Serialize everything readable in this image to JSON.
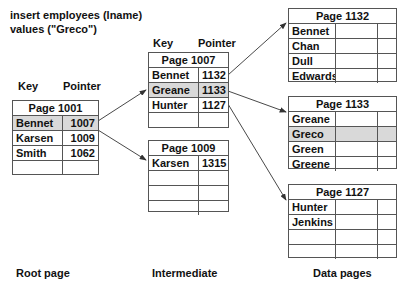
{
  "query": {
    "line1": "insert employees (lname)",
    "line2": "values (\"Greco\")"
  },
  "root": {
    "key_header": "Key",
    "pointer_header": "Pointer",
    "title": "Page 1001",
    "rows": [
      {
        "key": "Bennet",
        "pointer": "1007",
        "highlight": true
      },
      {
        "key": "Karsen",
        "pointer": "1009",
        "highlight": false
      },
      {
        "key": "Smith",
        "pointer": "1062",
        "highlight": false
      },
      {
        "key": "",
        "pointer": "",
        "highlight": false
      }
    ],
    "label": "Root page"
  },
  "intermediate": {
    "key_header": "Key",
    "pointer_header": "Pointer",
    "pages": [
      {
        "title": "Page 1007",
        "rows": [
          {
            "key": "Bennet",
            "pointer": "1132",
            "highlight": false
          },
          {
            "key": "Greane",
            "pointer": "1133",
            "highlight": true
          },
          {
            "key": "Hunter",
            "pointer": "1127",
            "highlight": false
          },
          {
            "key": "",
            "pointer": "",
            "highlight": false
          }
        ]
      },
      {
        "title": "Page 1009",
        "rows": [
          {
            "key": "Karsen",
            "pointer": "1315",
            "highlight": false
          },
          {
            "key": "",
            "pointer": "",
            "highlight": false
          },
          {
            "key": "",
            "pointer": "",
            "highlight": false
          },
          {
            "key": "",
            "pointer": "",
            "highlight": false
          }
        ]
      }
    ],
    "label": "Intermediate"
  },
  "data_pages": {
    "pages": [
      {
        "title": "Page 1132",
        "rows": [
          {
            "key": "Bennet",
            "highlight": false
          },
          {
            "key": "Chan",
            "highlight": false
          },
          {
            "key": "Dull",
            "highlight": false
          },
          {
            "key": "Edwards",
            "highlight": false
          }
        ]
      },
      {
        "title": "Page 1133",
        "rows": [
          {
            "key": "Greane",
            "highlight": false
          },
          {
            "key": "Greco",
            "highlight": true
          },
          {
            "key": "Green",
            "highlight": false
          },
          {
            "key": "Greene",
            "highlight": false
          }
        ]
      },
      {
        "title": "Page 1127",
        "rows": [
          {
            "key": "Hunter",
            "highlight": false
          },
          {
            "key": "Jenkins",
            "highlight": false
          },
          {
            "key": "",
            "highlight": false
          },
          {
            "key": "",
            "highlight": false
          }
        ]
      }
    ],
    "label": "Data pages"
  },
  "colors": {
    "highlight": "#d9d9d9",
    "border": "#555555",
    "arrow": "#333333"
  }
}
